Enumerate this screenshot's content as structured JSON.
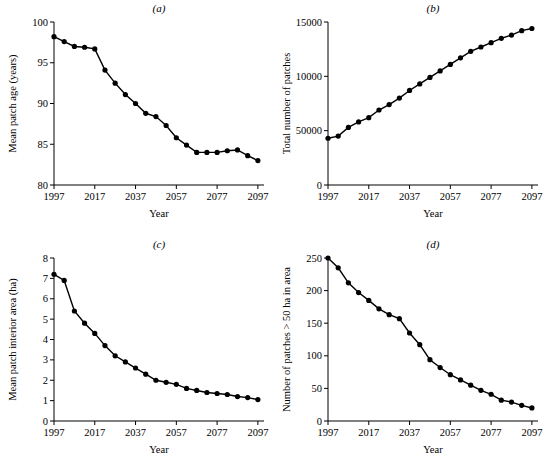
{
  "figure": {
    "panels": [
      "a",
      "b",
      "c",
      "d"
    ]
  },
  "chart_data": [
    {
      "id": "a",
      "type": "line",
      "title": "(a)",
      "xlabel": "Year",
      "ylabel": "Mean patch age (years)",
      "xlim": [
        1997,
        2100
      ],
      "ylim": [
        80,
        100
      ],
      "xticks": [
        1997,
        2017,
        2037,
        2057,
        2077,
        2097
      ],
      "yticks": [
        80,
        85,
        90,
        95,
        100
      ],
      "grid": false,
      "legend": "none",
      "marker": "filled-circle",
      "x": [
        1997,
        2002,
        2007,
        2012,
        2017,
        2022,
        2027,
        2032,
        2037,
        2042,
        2047,
        2052,
        2057,
        2062,
        2067,
        2072,
        2077,
        2082,
        2087,
        2092,
        2097
      ],
      "y": [
        98.2,
        97.6,
        97.0,
        96.9,
        96.7,
        94.1,
        92.5,
        91.1,
        90.0,
        88.8,
        88.4,
        87.3,
        85.8,
        84.9,
        84.0,
        84.0,
        84.0,
        84.2,
        84.3,
        83.6,
        83.0
      ]
    },
    {
      "id": "b",
      "type": "line",
      "title": "(b)",
      "xlabel": "Year",
      "ylabel": "Total number of patches",
      "xlim": [
        1997,
        2100
      ],
      "ylim": [
        0,
        15000
      ],
      "xticks": [
        1997,
        2017,
        2037,
        2057,
        2077,
        2097
      ],
      "yticks": [
        0,
        50000,
        10000,
        15000
      ],
      "ytick_labels": [
        "0",
        "50000",
        "10000",
        "15000"
      ],
      "grid": false,
      "legend": "none",
      "marker": "filled-circle",
      "x": [
        1997,
        2002,
        2007,
        2012,
        2017,
        2022,
        2027,
        2032,
        2037,
        2042,
        2047,
        2052,
        2057,
        2062,
        2067,
        2072,
        2077,
        2082,
        2087,
        2092,
        2097
      ],
      "y": [
        4300,
        4500,
        5300,
        5800,
        6200,
        6900,
        7400,
        8000,
        8700,
        9300,
        9900,
        10500,
        11100,
        11700,
        12300,
        12700,
        13100,
        13500,
        13800,
        14200,
        14400
      ]
    },
    {
      "id": "c",
      "type": "line",
      "title": "(c)",
      "xlabel": "Year",
      "ylabel": "Mean patch interior area (ha)",
      "xlim": [
        1997,
        2100
      ],
      "ylim": [
        0,
        8
      ],
      "xticks": [
        1997,
        2017,
        2037,
        2057,
        2077,
        2097
      ],
      "yticks": [
        0,
        1,
        2,
        3,
        4,
        5,
        6,
        7,
        8
      ],
      "grid": false,
      "legend": "none",
      "marker": "filled-circle",
      "x": [
        1997,
        2002,
        2007,
        2012,
        2017,
        2022,
        2027,
        2032,
        2037,
        2042,
        2047,
        2052,
        2057,
        2062,
        2067,
        2072,
        2077,
        2082,
        2087,
        2092,
        2097
      ],
      "y": [
        7.2,
        6.9,
        5.4,
        4.8,
        4.3,
        3.7,
        3.2,
        2.9,
        2.6,
        2.3,
        2.0,
        1.9,
        1.8,
        1.6,
        1.5,
        1.4,
        1.35,
        1.3,
        1.2,
        1.15,
        1.05
      ]
    },
    {
      "id": "d",
      "type": "line",
      "title": "(d)",
      "xlabel": "Year",
      "ylabel": "Number of patches > 50 ha in area",
      "xlim": [
        1997,
        2100
      ],
      "ylim": [
        0,
        250
      ],
      "xticks": [
        1997,
        2017,
        2037,
        2057,
        2077,
        2097
      ],
      "yticks": [
        0,
        50,
        100,
        150,
        200,
        250
      ],
      "grid": false,
      "legend": "none",
      "marker": "filled-circle",
      "x": [
        1997,
        2002,
        2007,
        2012,
        2017,
        2022,
        2027,
        2032,
        2037,
        2042,
        2047,
        2052,
        2057,
        2062,
        2067,
        2072,
        2077,
        2082,
        2087,
        2092,
        2097
      ],
      "y": [
        250,
        235,
        212,
        197,
        185,
        172,
        163,
        157,
        135,
        117,
        94,
        82,
        71,
        63,
        55,
        47,
        41,
        32,
        29,
        24,
        20
      ]
    }
  ]
}
